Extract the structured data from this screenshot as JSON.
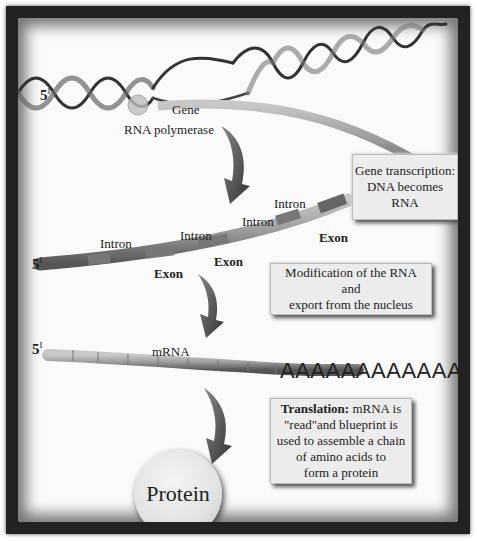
{
  "diagram": {
    "colors": {
      "frame": "#222222",
      "background": "#fafafa",
      "box": "#ececec",
      "strand": "#8a8a8a"
    },
    "dna": {
      "five_prime_label": "5",
      "prime_mark": "I",
      "gene_label": "Gene",
      "polymerase_label": "RNA polymerase"
    },
    "transcription_box": {
      "lines": [
        "Gene transcription:",
        "DNA becomes",
        "RNA"
      ]
    },
    "pre_mrna": {
      "five_prime_label": "5",
      "prime_mark": "I",
      "introns": [
        "Intron",
        "Intron",
        "Intron",
        "Intron"
      ],
      "exons": [
        "Exon",
        "Exon",
        "Exon"
      ]
    },
    "modification_box": {
      "lines": [
        "Modification of the RNA",
        "and",
        "export from the nucleus"
      ]
    },
    "mrna": {
      "five_prime_label": "5",
      "prime_mark": "I",
      "label": "mRNA",
      "poly_a_tail": "AAAAAAAAAAAA"
    },
    "translation_box": {
      "bold_prefix": "Translation:",
      "first_line_rest": " mRNA is",
      "lines": [
        "\"read\"and blueprint is",
        "used to assemble a chain",
        "of amino acids to",
        "form a protein"
      ]
    },
    "protein_label": "Protein",
    "arrows": [
      "arrow-down-curved",
      "arrow-down-curved",
      "arrow-down-curved"
    ]
  }
}
